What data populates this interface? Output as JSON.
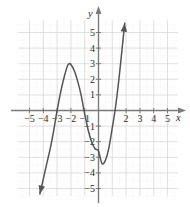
{
  "figure": {
    "kind": "coordinate-graph",
    "background_color": "#ffffff",
    "grid_color": "#d8d8d8",
    "grid_minor_color": "#e8e8e8",
    "axis_color": "#7a7a7a",
    "curve_color": "#555555",
    "text_color": "#2b2b2b"
  },
  "axes": {
    "x_label": "x",
    "y_label": "y",
    "x_ticks": [
      {
        "value": -5,
        "label": "−5"
      },
      {
        "value": -4,
        "label": "−4"
      },
      {
        "value": -3,
        "label": "−3"
      },
      {
        "value": -2,
        "label": "−2"
      },
      {
        "value": -1,
        "label": "−1"
      },
      {
        "value": 2,
        "label": "2"
      },
      {
        "value": 3,
        "label": "3"
      },
      {
        "value": 4,
        "label": "4"
      },
      {
        "value": 5,
        "label": "5"
      }
    ],
    "y_ticks": [
      {
        "value": 5,
        "label": "5"
      },
      {
        "value": 4,
        "label": "4"
      },
      {
        "value": 3,
        "label": "3"
      },
      {
        "value": 2,
        "label": "2"
      },
      {
        "value": 1,
        "label": "1"
      },
      {
        "value": -1,
        "label": "−1"
      },
      {
        "value": -2,
        "label": "−2"
      },
      {
        "value": -3,
        "label": "−3"
      },
      {
        "value": -4,
        "label": "−4"
      },
      {
        "value": -5,
        "label": "−5"
      }
    ],
    "xlim": [
      -6.0,
      6.2
    ],
    "ylim": [
      -6.2,
      6.4
    ],
    "grid": true
  },
  "chart_data": {
    "type": "line",
    "title": "",
    "xlabel": "x",
    "ylabel": "y",
    "xlim": [
      -6.0,
      6.2
    ],
    "ylim": [
      -6.2,
      6.4
    ],
    "grid": true,
    "legend": "none",
    "series": [
      {
        "name": "cubic curve",
        "shape": "cubic",
        "arrow_start": true,
        "arrow_end": true,
        "x_intercepts": [
          -3.0,
          -1.05,
          1.2
        ],
        "local_maximum": {
          "x": -2.1,
          "y": 3.0
        },
        "local_minimum": {
          "x": 0.25,
          "y": -3.4
        },
        "y_intercept": -2.6,
        "start_point": {
          "x": -4.25,
          "y": -5.35
        },
        "end_point": {
          "x": 1.9,
          "y": 5.6
        },
        "points": [
          {
            "x": -4.25,
            "y": -5.35
          },
          {
            "x": -4.0,
            "y": -4.4
          },
          {
            "x": -3.75,
            "y": -3.4
          },
          {
            "x": -3.5,
            "y": -2.45
          },
          {
            "x": -3.25,
            "y": -1.3
          },
          {
            "x": -3.0,
            "y": 0.0
          },
          {
            "x": -2.75,
            "y": 1.15
          },
          {
            "x": -2.5,
            "y": 2.1
          },
          {
            "x": -2.25,
            "y": 2.85
          },
          {
            "x": -2.1,
            "y": 3.0
          },
          {
            "x": -2.0,
            "y": 2.95
          },
          {
            "x": -1.75,
            "y": 2.55
          },
          {
            "x": -1.5,
            "y": 1.85
          },
          {
            "x": -1.25,
            "y": 0.95
          },
          {
            "x": -1.05,
            "y": 0.0
          },
          {
            "x": -0.75,
            "y": -1.25
          },
          {
            "x": -0.5,
            "y": -2.0
          },
          {
            "x": -0.25,
            "y": -2.45
          },
          {
            "x": 0.0,
            "y": -2.6
          },
          {
            "x": 0.25,
            "y": -3.4
          },
          {
            "x": 0.5,
            "y": -3.2
          },
          {
            "x": 0.75,
            "y": -2.4
          },
          {
            "x": 1.0,
            "y": -1.1
          },
          {
            "x": 1.2,
            "y": 0.0
          },
          {
            "x": 1.4,
            "y": 1.4
          },
          {
            "x": 1.6,
            "y": 3.0
          },
          {
            "x": 1.75,
            "y": 4.3
          },
          {
            "x": 1.9,
            "y": 5.6
          }
        ]
      }
    ]
  }
}
